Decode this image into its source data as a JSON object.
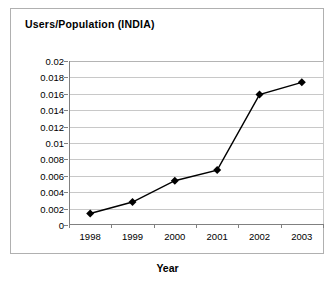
{
  "chart_data": {
    "type": "line",
    "title": "Users/Population (INDIA)",
    "xlabel": "Year",
    "ylabel": "",
    "categories": [
      "1998",
      "1999",
      "2000",
      "2001",
      "2002",
      "2003"
    ],
    "values": [
      0.0014,
      0.0028,
      0.0054,
      0.0067,
      0.0159,
      0.0174
    ],
    "series": [
      {
        "name": "Users/Population (INDIA)",
        "values": [
          0.0014,
          0.0028,
          0.0054,
          0.0067,
          0.0159,
          0.0174
        ]
      }
    ],
    "ylim": [
      0,
      0.02
    ],
    "ytick_step": 0.002,
    "ytick_labels": [
      "0.02",
      "0.018",
      "0.016",
      "0.014",
      "0.012",
      "0.01",
      "0.008",
      "0.006",
      "0.004",
      "0.002",
      "0"
    ],
    "ytick_values": [
      0.02,
      0.018,
      0.016,
      0.014,
      0.012,
      0.01,
      0.008,
      0.006,
      0.004,
      0.002,
      0
    ],
    "xtick_labels": [
      "1998",
      "1999",
      "2000",
      "2001",
      "2002",
      "2003"
    ],
    "grid": true,
    "grid_axis": "y",
    "legend": false,
    "legend_position": "none",
    "marker": "diamond",
    "marker_color": "#000000",
    "line_color": "#000000",
    "plot_background": "#ffffff",
    "grid_color": "#c8c8c8",
    "axis_color": "#808080",
    "border_color": "#b0b0b0"
  }
}
